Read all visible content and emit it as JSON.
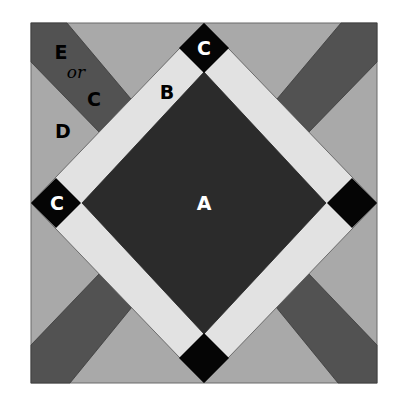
{
  "figure": {
    "colors": {
      "background": "#ffffff",
      "A": "#2b2b2b",
      "B": "#e2e2e2",
      "C": "#050505",
      "D": "#a9a9a9",
      "E": "#525252",
      "outline": "#6a6a6a",
      "label_dark": "#000000",
      "label_light": "#ffffff"
    },
    "labels": {
      "A": "A",
      "B": "B",
      "C_top": "C",
      "C_left": "C",
      "E": "E",
      "or": "or",
      "E_alt": "C",
      "D": "D"
    },
    "pieces": [
      {
        "id": "A",
        "description": "center dark square set on point"
      },
      {
        "id": "B",
        "description": "light sashing strips around center"
      },
      {
        "id": "C",
        "description": "black corner squares at four diamond points"
      },
      {
        "id": "D",
        "description": "medium gray corner triangles"
      },
      {
        "id": "E or C",
        "description": "dark diagonal strips in corners"
      }
    ]
  }
}
